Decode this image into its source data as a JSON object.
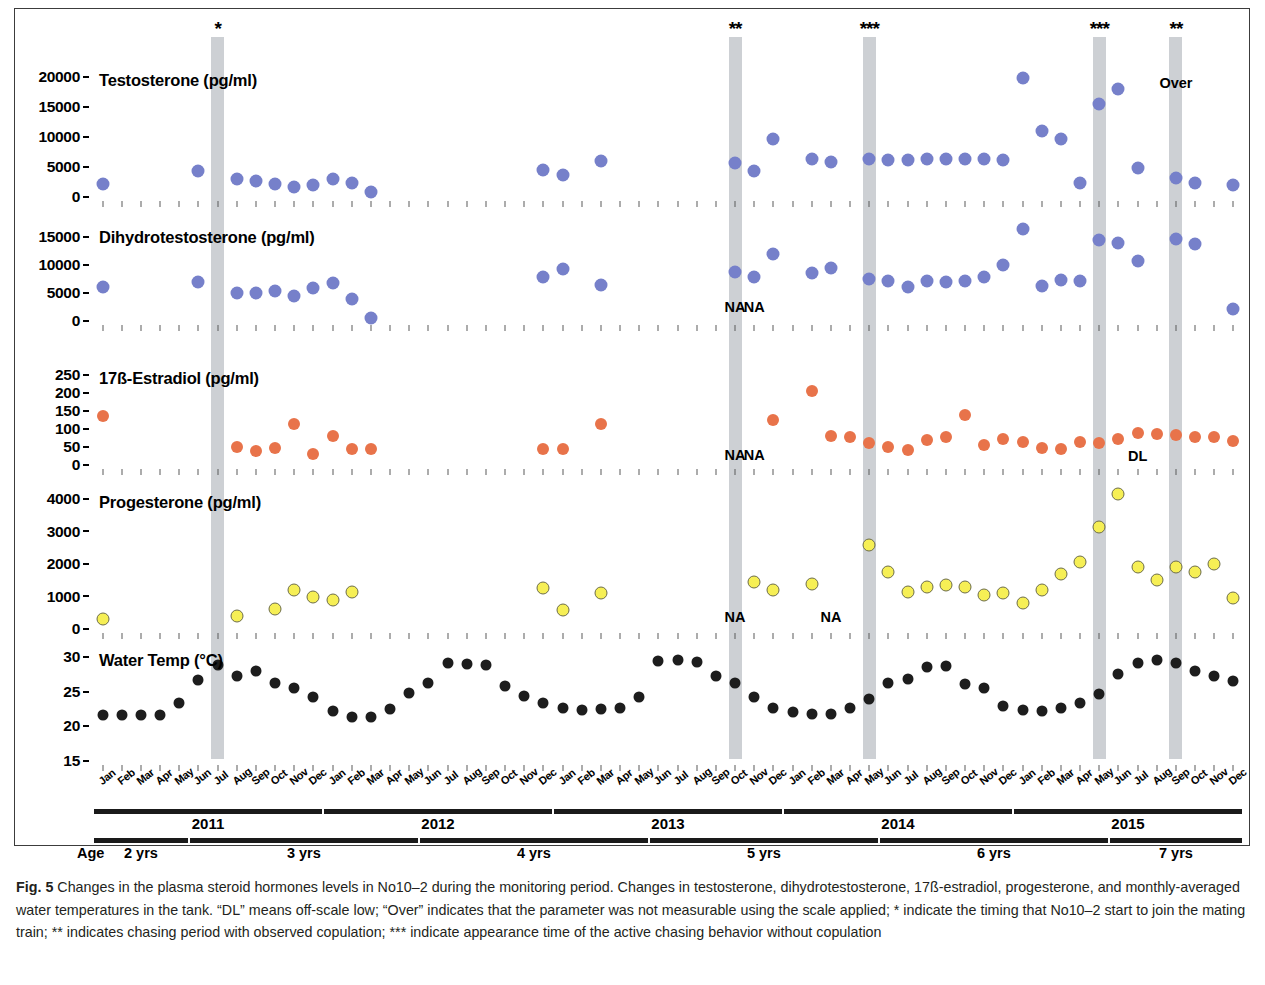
{
  "figure": {
    "label": "Fig. 5",
    "caption": "Changes in the plasma steroid hormones levels in No10–2 during the monitoring period. Changes in testosterone, dihydrotestosterone, 17ß-estradiol, progesterone, and monthly-averaged water temperatures in the tank. “DL” means off-scale low; “Over” indicates that the parameter was not measurable using the scale applied; * indicate the timing that No10–2 start to join the mating train; ** indicates chasing period with observed copulation; *** indicate appearance time of the active chasing behavior without copulation"
  },
  "axis": {
    "months": [
      "Jan",
      "Feb",
      "Mar",
      "Apr",
      "May",
      "Jun",
      "Jul",
      "Aug",
      "Sep",
      "Oct",
      "Nov",
      "Dec"
    ],
    "years": [
      {
        "label": "2011",
        "start": 0,
        "end": 11
      },
      {
        "label": "2012",
        "start": 12,
        "end": 23
      },
      {
        "label": "2013",
        "start": 24,
        "end": 35
      },
      {
        "label": "2014",
        "start": 36,
        "end": 47
      },
      {
        "label": "2015",
        "start": 48,
        "end": 59
      }
    ],
    "age_word": "Age",
    "ages": [
      {
        "label": "2 yrs",
        "start": 0,
        "end": 4
      },
      {
        "label": "3 yrs",
        "start": 5,
        "end": 16
      },
      {
        "label": "4 yrs",
        "start": 17,
        "end": 28
      },
      {
        "label": "5 yrs",
        "start": 29,
        "end": 40
      },
      {
        "label": "6 yrs",
        "start": 41,
        "end": 52
      },
      {
        "label": "7 yrs",
        "start": 53,
        "end": 59
      }
    ]
  },
  "events": [
    {
      "stars": "*",
      "month_index": 6,
      "note": "start to join the mating train"
    },
    {
      "stars": "**",
      "month_index": 33,
      "note": "chasing period with observed copulation"
    },
    {
      "stars": "***",
      "month_index": 40,
      "note": "active chasing behavior without copulation"
    },
    {
      "stars": "***",
      "month_index": 52,
      "note": "active chasing behavior without copulation"
    },
    {
      "stars": "**",
      "month_index": 56,
      "note": "chasing period with observed copulation"
    }
  ],
  "colors": {
    "testosterone": "#7680ca",
    "dihydrotestosterone": "#7680ca",
    "estradiol": "#e8734a",
    "progesterone": "#f6ef55",
    "water_temp": "#1d1d1d",
    "band": "#c6c9ce"
  },
  "chart_data": [
    {
      "type": "scatter",
      "title": "Testosterone (pg/ml)",
      "ylabel": "Testosterone (pg/ml)",
      "xlabel": "",
      "ylim": [
        0,
        20000
      ],
      "yticks": [
        0,
        5000,
        10000,
        15000,
        20000
      ],
      "grid": false,
      "x": [
        "Jan 2011",
        "Jun 2011",
        "Aug 2011",
        "Sep 2011",
        "Oct 2011",
        "Nov 2011",
        "Dec 2011",
        "Jan 2012",
        "Feb 2012",
        "Mar 2012",
        "Dec 2012",
        "Jan 2013",
        "Mar 2013",
        "Oct 2013",
        "Nov 2013",
        "Dec 2013",
        "Feb 2014",
        "Mar 2014",
        "May 2014",
        "Jun 2014",
        "Jul 2014",
        "Aug 2014",
        "Sep 2014",
        "Oct 2014",
        "Nov 2014",
        "Dec 2014",
        "Jan 2015",
        "Feb 2015",
        "Mar 2015",
        "Apr 2015",
        "May 2015",
        "Jun 2015",
        "Jul 2015",
        "Sep 2015",
        "Oct 2015",
        "Dec 2015"
      ],
      "values": [
        2100,
        4300,
        3000,
        2700,
        2200,
        1700,
        2000,
        3000,
        2300,
        800,
        4500,
        3600,
        6000,
        5600,
        4300,
        9600,
        6400,
        5800,
        6400,
        6100,
        6200,
        6300,
        6300,
        6400,
        6300,
        6200,
        19900,
        11000,
        9600,
        2400,
        15500,
        18000,
        4900,
        3200,
        2300,
        2000
      ],
      "annotations": [
        {
          "text": "Over",
          "x": "Sep 2015",
          "y": 18800
        }
      ]
    },
    {
      "type": "scatter",
      "title": "Dihydrotestosterone (pg/ml)",
      "ylabel": "Dihydrotestosterone (pg/ml)",
      "xlabel": "",
      "ylim": [
        0,
        15000
      ],
      "yticks": [
        0,
        5000,
        10000,
        15000
      ],
      "grid": false,
      "x": [
        "Jan 2011",
        "Jun 2011",
        "Aug 2011",
        "Sep 2011",
        "Oct 2011",
        "Nov 2011",
        "Dec 2011",
        "Jan 2012",
        "Feb 2012",
        "Mar 2012",
        "Dec 2012",
        "Jan 2013",
        "Mar 2013",
        "Oct 2013",
        "Nov 2013",
        "Dec 2013",
        "Feb 2014",
        "Mar 2014",
        "May 2014",
        "Jun 2014",
        "Jul 2014",
        "Aug 2014",
        "Sep 2014",
        "Oct 2014",
        "Nov 2014",
        "Dec 2014",
        "Jan 2015",
        "Feb 2015",
        "Mar 2015",
        "Apr 2015",
        "May 2015",
        "Jun 2015",
        "Jul 2015",
        "Sep 2015",
        "Oct 2015",
        "Dec 2015"
      ],
      "values": [
        6000,
        7000,
        5000,
        5000,
        5400,
        4400,
        5900,
        6800,
        4000,
        600,
        7900,
        9300,
        6400,
        8700,
        7900,
        12000,
        8600,
        9400,
        7500,
        7200,
        6100,
        7100,
        7000,
        7100,
        7800,
        10000,
        16400,
        6200,
        7300,
        7200,
        14500,
        14000,
        10700,
        14700,
        13700,
        2200
      ],
      "annotations": [
        {
          "text": "NA",
          "x": "Oct 2013",
          "y": 2300
        },
        {
          "text": "NA",
          "x": "Nov 2013",
          "y": 2300
        }
      ]
    },
    {
      "type": "scatter",
      "title": "17ß-Estradiol (pg/ml)",
      "ylabel": "17ß-Estradiol (pg/ml)",
      "xlabel": "",
      "ylim": [
        0,
        250
      ],
      "yticks": [
        0,
        50,
        100,
        150,
        200,
        250
      ],
      "grid": false,
      "x": [
        "Jan 2011",
        "Aug 2011",
        "Sep 2011",
        "Oct 2011",
        "Nov 2011",
        "Dec 2011",
        "Jan 2012",
        "Feb 2012",
        "Mar 2012",
        "Dec 2012",
        "Jan 2013",
        "Mar 2013",
        "Dec 2013",
        "Feb 2014",
        "Mar 2014",
        "Apr 2014",
        "May 2014",
        "Jun 2014",
        "Jul 2014",
        "Aug 2014",
        "Sep 2014",
        "Oct 2014",
        "Nov 2014",
        "Dec 2014",
        "Jan 2015",
        "Feb 2015",
        "Mar 2015",
        "Apr 2015",
        "May 2015",
        "Jun 2015",
        "Jul 2015",
        "Aug 2015",
        "Sep 2015",
        "Oct 2015",
        "Nov 2015",
        "Dec 2015"
      ],
      "values": [
        135,
        50,
        40,
        48,
        115,
        30,
        80,
        45,
        45,
        45,
        45,
        115,
        125,
        205,
        80,
        78,
        62,
        50,
        42,
        70,
        78,
        140,
        55,
        72,
        65,
        48,
        45,
        65,
        62,
        72,
        90,
        85,
        82,
        78,
        78,
        68
      ],
      "annotations": [
        {
          "text": "NA",
          "x": "Oct 2013",
          "y": 25
        },
        {
          "text": "NA",
          "x": "Nov 2013",
          "y": 25
        },
        {
          "text": "DL",
          "x": "Jul 2015",
          "y": 22
        }
      ]
    },
    {
      "type": "scatter",
      "title": "Progesterone (pg/ml)",
      "ylabel": "Progesterone (pg/ml)",
      "xlabel": "",
      "ylim": [
        0,
        4000
      ],
      "yticks": [
        0,
        1000,
        2000,
        3000,
        4000
      ],
      "grid": false,
      "x": [
        "Jan 2011",
        "Aug 2011",
        "Oct 2011",
        "Nov 2011",
        "Dec 2011",
        "Jan 2012",
        "Feb 2012",
        "Dec 2012",
        "Jan 2013",
        "Mar 2013",
        "Nov 2013",
        "Dec 2013",
        "Feb 2014",
        "May 2014",
        "Jun 2014",
        "Jul 2014",
        "Aug 2014",
        "Sep 2014",
        "Oct 2014",
        "Nov 2014",
        "Dec 2014",
        "Jan 2015",
        "Feb 2015",
        "Mar 2015",
        "Apr 2015",
        "May 2015",
        "Jun 2015",
        "Jul 2015",
        "Aug 2015",
        "Sep 2015",
        "Oct 2015",
        "Nov 2015",
        "Dec 2015"
      ],
      "values": [
        300,
        400,
        620,
        1200,
        1000,
        900,
        1150,
        1250,
        580,
        1100,
        1450,
        1200,
        1400,
        2600,
        1750,
        1150,
        1300,
        1350,
        1300,
        1050,
        1100,
        800,
        1200,
        1700,
        2050,
        3150,
        4150,
        1900,
        1500,
        1900,
        1750,
        2000,
        950
      ],
      "annotations": [
        {
          "text": "NA",
          "x": "Oct 2013",
          "y": 330
        },
        {
          "text": "NA",
          "x": "Mar 2014",
          "y": 330
        }
      ]
    },
    {
      "type": "scatter",
      "title": "Water Temp (°C)",
      "ylabel": "Water Temp (°C)",
      "xlabel": "",
      "ylim": [
        15,
        30
      ],
      "yticks": [
        15,
        20,
        25,
        30
      ],
      "grid": false,
      "x": [
        "Jan 2011",
        "Feb 2011",
        "Mar 2011",
        "Apr 2011",
        "May 2011",
        "Jun 2011",
        "Jul 2011",
        "Aug 2011",
        "Sep 2011",
        "Oct 2011",
        "Nov 2011",
        "Dec 2011",
        "Jan 2012",
        "Feb 2012",
        "Mar 2012",
        "Apr 2012",
        "May 2012",
        "Jun 2012",
        "Jul 2012",
        "Aug 2012",
        "Sep 2012",
        "Oct 2012",
        "Nov 2012",
        "Dec 2012",
        "Jan 2013",
        "Feb 2013",
        "Mar 2013",
        "Apr 2013",
        "May 2013",
        "Jun 2013",
        "Jul 2013",
        "Aug 2013",
        "Sep 2013",
        "Oct 2013",
        "Nov 2013",
        "Dec 2013",
        "Jan 2014",
        "Feb 2014",
        "Mar 2014",
        "Apr 2014",
        "May 2014",
        "Jun 2014",
        "Jul 2014",
        "Aug 2014",
        "Sep 2014",
        "Oct 2014",
        "Nov 2014",
        "Dec 2014",
        "Jan 2015",
        "Feb 2015",
        "Mar 2015",
        "Apr 2015",
        "May 2015",
        "Jun 2015",
        "Jul 2015",
        "Aug 2015",
        "Sep 2015",
        "Oct 2015",
        "Nov 2015",
        "Dec 2015"
      ],
      "values": [
        21.6,
        21.6,
        21.6,
        21.6,
        23.4,
        26.7,
        28.8,
        27.3,
        28.0,
        26.2,
        25.6,
        24.3,
        22.2,
        21.3,
        21.3,
        22.5,
        24.8,
        26.2,
        29.1,
        29.0,
        28.8,
        25.8,
        24.4,
        23.3,
        22.6,
        22.3,
        22.5,
        22.7,
        24.3,
        29.4,
        29.6,
        29.3,
        27.2,
        26.3,
        24.2,
        22.7,
        22.0,
        21.8,
        21.8,
        22.7,
        23.9,
        26.2,
        26.8,
        28.5,
        28.7,
        26.1,
        25.5,
        23.0,
        22.3,
        22.2,
        22.6,
        23.3,
        24.7,
        27.5,
        29.1,
        29.6,
        29.2,
        28.0,
        27.2,
        26.5
      ]
    }
  ]
}
